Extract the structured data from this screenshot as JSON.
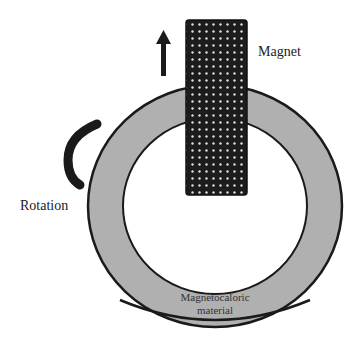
{
  "diagram": {
    "labels": {
      "magnet": "Magnet",
      "rotation": "Rotation",
      "material_line1": "Magnetocaloric",
      "material_line2": "material"
    },
    "colors": {
      "ring_fill": "#b0b0b0",
      "ring_stroke": "#1a1a1a",
      "magnet_fill": "#1c1c1c",
      "magnet_dots": "#e0e0e0",
      "arrow": "#1a1a1a",
      "background": "#ffffff"
    },
    "components": [
      {
        "id": "ring",
        "type": "annulus",
        "role": "magnetocaloric material"
      },
      {
        "id": "magnet",
        "type": "rectangle",
        "role": "magnet",
        "motion": "upward arrow"
      },
      {
        "id": "rotation-arrow",
        "type": "arc",
        "role": "rotation indicator"
      }
    ]
  }
}
